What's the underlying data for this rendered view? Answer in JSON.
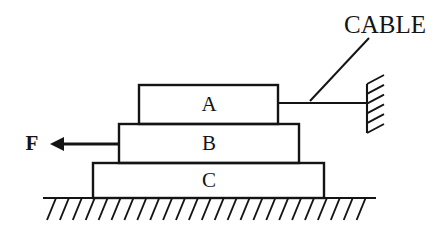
{
  "diagram": {
    "background_color": "#ffffff",
    "line_color": "#141414",
    "blocks": [
      {
        "id": "block-a",
        "label": "A",
        "x": 139,
        "y": 85,
        "width": 139,
        "height": 39,
        "label_x": 209,
        "label_y": 105
      },
      {
        "id": "block-b",
        "label": "B",
        "x": 119,
        "y": 124,
        "width": 180,
        "height": 39,
        "label_x": 209,
        "label_y": 144
      },
      {
        "id": "block-c",
        "label": "C",
        "x": 93,
        "y": 163,
        "width": 231,
        "height": 35,
        "label_x": 209,
        "label_y": 181
      }
    ],
    "cable": {
      "label": "CABLE",
      "label_x": 344,
      "label_y": 33,
      "line_x1": 278,
      "line_x2": 368,
      "line_y": 103,
      "leader_x1": 310,
      "leader_y1": 101,
      "leader_x2": 369,
      "leader_y2": 38
    },
    "wall": {
      "x": 367,
      "y_top": 84,
      "y_bottom": 133,
      "hatch_count": 6,
      "hatch_length": 17,
      "hatch_rise": 9
    },
    "force": {
      "label": "F",
      "label_x": 32,
      "label_y": 144,
      "shaft_x1": 119,
      "shaft_x2": 62,
      "shaft_y": 144,
      "tip_x": 50,
      "head_half_height": 7,
      "head_length": 13
    },
    "ground": {
      "line_x1": 43,
      "line_x2": 376,
      "line_y": 198,
      "hatch_count": 25,
      "hatch_start_x": 56,
      "hatch_spacing": 12.9,
      "hatch_dx": -9,
      "hatch_dy": 22
    }
  }
}
